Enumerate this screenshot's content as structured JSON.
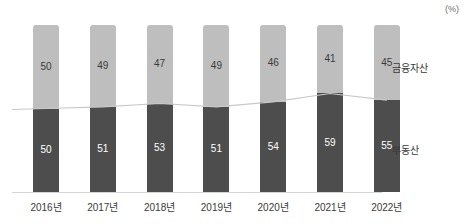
{
  "unit_label": "(%)",
  "legend": {
    "top_label": "금융자산",
    "bottom_label": "부동산"
  },
  "colors": {
    "top_segment": "#bebebe",
    "bottom_segment": "#4d4d4d",
    "connector_line": "#c8c8c8",
    "axis": "#d5d5d5",
    "top_value_text": "#3a3a3a",
    "bottom_value_text": "#ffffff"
  },
  "chart_data": {
    "type": "bar",
    "subtype": "stacked-bar-100-percent",
    "title": "",
    "subtitle": "",
    "xlabel": "",
    "ylabel": "",
    "unit": "(%)",
    "ylim": [
      0,
      100
    ],
    "grid": false,
    "legend_position": "right",
    "categories": [
      "2016년",
      "2017년",
      "2018년",
      "2019년",
      "2020년",
      "2021년",
      "2022년"
    ],
    "series": [
      {
        "name": "금융자산",
        "values": [
          50,
          49,
          47,
          49,
          46,
          41,
          45
        ],
        "color": "#bebebe",
        "stack_position": "top"
      },
      {
        "name": "부동산",
        "values": [
          50,
          51,
          53,
          51,
          54,
          59,
          55
        ],
        "color": "#4d4d4d",
        "stack_position": "bottom"
      }
    ],
    "overlay_line": {
      "name": "부동산 비중 추이",
      "values": [
        50,
        51,
        53,
        51,
        54,
        59,
        55
      ],
      "color": "#c8c8c8"
    }
  },
  "bars": [
    {
      "category": "2016년",
      "top_value": "50",
      "bottom_value": "50"
    },
    {
      "category": "2017년",
      "top_value": "49",
      "bottom_value": "51"
    },
    {
      "category": "2018년",
      "top_value": "47",
      "bottom_value": "53"
    },
    {
      "category": "2019년",
      "top_value": "49",
      "bottom_value": "51"
    },
    {
      "category": "2020년",
      "top_value": "46",
      "bottom_value": "54"
    },
    {
      "category": "2021년",
      "top_value": "41",
      "bottom_value": "59"
    },
    {
      "category": "2022년",
      "top_value": "45",
      "bottom_value": "55"
    }
  ]
}
